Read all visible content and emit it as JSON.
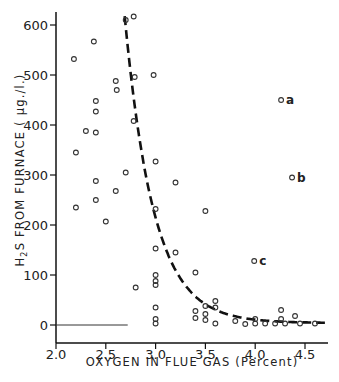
{
  "chart_data": {
    "type": "scatter",
    "title": "",
    "xlabel": "OXYGEN IN FLUE GAS (Percent)",
    "ylabel": "H2S FROM FURNACE (µg./l.)",
    "xlim": [
      2.0,
      4.75
    ],
    "ylim": [
      -40,
      630
    ],
    "x_ticks": [
      "2.0",
      "2.5",
      "3.0",
      "3.5",
      "4.0",
      "4.5"
    ],
    "y_ticks": [
      "0",
      "100",
      "200",
      "300",
      "400",
      "500",
      "600"
    ],
    "grid": false,
    "legend": null,
    "series": [
      {
        "name": "observations",
        "marker": "open-circle",
        "points": [
          [
            2.18,
            532
          ],
          [
            2.2,
            345
          ],
          [
            2.2,
            235
          ],
          [
            2.3,
            388
          ],
          [
            2.38,
            567
          ],
          [
            2.4,
            448
          ],
          [
            2.4,
            427
          ],
          [
            2.4,
            385
          ],
          [
            2.4,
            288
          ],
          [
            2.4,
            250
          ],
          [
            2.5,
            207
          ],
          [
            2.6,
            488
          ],
          [
            2.61,
            470
          ],
          [
            2.6,
            268
          ],
          [
            2.7,
            610
          ],
          [
            2.7,
            305
          ],
          [
            2.78,
            617
          ],
          [
            2.79,
            496
          ],
          [
            2.78,
            408
          ],
          [
            2.8,
            75
          ],
          [
            2.98,
            500
          ],
          [
            3.0,
            327
          ],
          [
            3.0,
            232
          ],
          [
            3.0,
            153
          ],
          [
            3.0,
            100
          ],
          [
            3.0,
            88
          ],
          [
            3.0,
            80
          ],
          [
            3.0,
            35
          ],
          [
            3.0,
            12
          ],
          [
            3.0,
            3
          ],
          [
            3.2,
            285
          ],
          [
            3.2,
            145
          ],
          [
            3.4,
            105
          ],
          [
            3.5,
            228
          ],
          [
            3.4,
            28
          ],
          [
            3.4,
            14
          ],
          [
            3.5,
            38
          ],
          [
            3.5,
            22
          ],
          [
            3.5,
            10
          ],
          [
            3.6,
            48
          ],
          [
            3.6,
            35
          ],
          [
            3.6,
            3
          ],
          [
            3.8,
            8
          ],
          [
            3.9,
            2
          ],
          [
            4.0,
            12
          ],
          [
            4.0,
            3
          ],
          [
            4.1,
            3
          ],
          [
            4.2,
            3
          ],
          [
            4.26,
            30
          ],
          [
            4.26,
            12
          ],
          [
            4.3,
            3
          ],
          [
            4.4,
            18
          ],
          [
            4.45,
            3
          ],
          [
            4.6,
            3
          ]
        ]
      },
      {
        "name": "labeled outliers",
        "marker": "open-circle",
        "points": [
          {
            "x": 4.26,
            "y": 450,
            "label": "a"
          },
          {
            "x": 4.37,
            "y": 295,
            "label": "b"
          },
          {
            "x": 3.99,
            "y": 128,
            "label": "c"
          }
        ]
      }
    ],
    "fitted_curve": {
      "style": "dashed",
      "description": "exponential decay fit",
      "points": [
        [
          2.65,
          630
        ],
        [
          2.75,
          470
        ],
        [
          2.85,
          340
        ],
        [
          3.0,
          215
        ],
        [
          3.2,
          120
        ],
        [
          3.4,
          65
        ],
        [
          3.6,
          35
        ],
        [
          3.8,
          18
        ],
        [
          4.0,
          10
        ],
        [
          4.3,
          6
        ],
        [
          4.7,
          4
        ]
      ]
    },
    "baseline_segment": {
      "x_from": 2.0,
      "x_to": 2.72,
      "y": 0
    }
  },
  "labels": {
    "y_axis_title_part1": "H",
    "y_axis_title_sub": "2",
    "y_axis_title_part2": "S  FROM  FURNACE   ( µg./l.)",
    "x_axis_title": "OXYGEN   IN  FLUE  GAS  (Percent)"
  }
}
